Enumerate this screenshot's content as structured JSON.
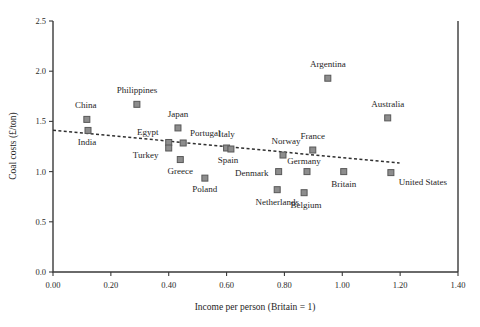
{
  "chart_data": {
    "type": "scatter",
    "title": "",
    "xlabel": "Income per person (Britain = 1)",
    "ylabel": "Coal costs (£/ton)",
    "xlim": [
      0.0,
      1.4
    ],
    "ylim": [
      0.0,
      2.5
    ],
    "xticks": [
      0.0,
      0.2,
      0.4,
      0.6,
      0.8,
      1.0,
      1.2,
      1.4
    ],
    "xticklabels": [
      "0.00",
      "0.20",
      "0.40",
      "0.60",
      "0.80",
      "1.00",
      "1.20",
      "1.40"
    ],
    "yticks": [
      0.0,
      0.5,
      1.0,
      1.5,
      2.0,
      2.5
    ],
    "yticklabels": [
      "0.0",
      "0.5",
      "1.0",
      "1.5",
      "2.0",
      "2.5"
    ],
    "grid": false,
    "legend": "none",
    "marker": "square",
    "marker_color": "#8d8d8d",
    "marker_edge_color": "#585858",
    "points": [
      {
        "label": "China",
        "x": 0.117,
        "y": 1.52,
        "label_dx": -1,
        "label_dy": -11
      },
      {
        "label": "India",
        "x": 0.121,
        "y": 1.41,
        "label_dx": -1,
        "label_dy": 15
      },
      {
        "label": "Philippines",
        "x": 0.29,
        "y": 1.67,
        "label_dx": 0,
        "label_dy": -11
      },
      {
        "label": "Egypt",
        "x": 0.4,
        "y": 1.29,
        "label_dx": -21,
        "label_dy": -7
      },
      {
        "label": "Turkey",
        "x": 0.4,
        "y": 1.235,
        "label_dx": -23,
        "label_dy": 10
      },
      {
        "label": "Japan",
        "x": 0.432,
        "y": 1.435,
        "label_dx": 0,
        "label_dy": -11
      },
      {
        "label": "Portugal",
        "x": 0.45,
        "y": 1.285,
        "label_dx": 22,
        "label_dy": -7
      },
      {
        "label": "Greece",
        "x": 0.44,
        "y": 1.12,
        "label_dx": 0,
        "label_dy": 14
      },
      {
        "label": "Poland",
        "x": 0.525,
        "y": 0.935,
        "label_dx": 0,
        "label_dy": 14
      },
      {
        "label": "Italy",
        "x": 0.6,
        "y": 1.235,
        "label_dx": 0,
        "label_dy": -11
      },
      {
        "label": "Spain",
        "x": 0.615,
        "y": 1.225,
        "label_dx": -3,
        "label_dy": 14
      },
      {
        "label": "Norway",
        "x": 0.795,
        "y": 1.165,
        "label_dx": 3,
        "label_dy": -11
      },
      {
        "label": "Denmark",
        "x": 0.78,
        "y": 1.0,
        "label_dx": -27,
        "label_dy": 4
      },
      {
        "label": "Netherlands",
        "x": 0.775,
        "y": 0.82,
        "label_dx": 0,
        "label_dy": 15
      },
      {
        "label": "Germany",
        "x": 0.878,
        "y": 1.0,
        "label_dx": -3,
        "label_dy": -8
      },
      {
        "label": "Belgium",
        "x": 0.868,
        "y": 0.79,
        "label_dx": 2,
        "label_dy": 15
      },
      {
        "label": "France",
        "x": 0.898,
        "y": 1.215,
        "label_dx": 0,
        "label_dy": -11
      },
      {
        "label": "Argentina",
        "x": 0.95,
        "y": 1.93,
        "label_dx": 0,
        "label_dy": -11
      },
      {
        "label": "Britain",
        "x": 1.005,
        "y": 1.0,
        "label_dx": 0,
        "label_dy": 15
      },
      {
        "label": "Australia",
        "x": 1.157,
        "y": 1.535,
        "label_dx": 0,
        "label_dy": -11
      },
      {
        "label": "United States",
        "x": 1.168,
        "y": 0.99,
        "label_dx": 32,
        "label_dy": 12
      }
    ],
    "trend_line": {
      "style": "dotted",
      "x_start": 0.0,
      "y_start": 1.413,
      "x_end": 1.198,
      "y_end": 1.085
    }
  }
}
